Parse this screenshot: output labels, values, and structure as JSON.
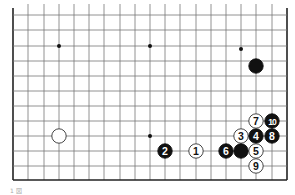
{
  "board": {
    "left": 13,
    "top": 15,
    "right": 287,
    "bottom": 180,
    "cols_x": [
      13,
      28,
      44,
      59,
      74,
      89,
      104,
      120,
      135,
      150,
      165,
      180,
      196,
      211,
      226,
      241,
      256,
      272,
      287
    ],
    "rows_y": [
      15,
      30,
      46,
      61,
      76,
      91,
      106,
      121,
      136,
      151,
      166,
      180
    ],
    "edges": [
      "left",
      "right",
      "bottom"
    ],
    "line_color": "#777777",
    "edge_color": "#222222"
  },
  "star_points": [
    {
      "x": 59,
      "y": 46
    },
    {
      "x": 150,
      "y": 46
    },
    {
      "x": 241,
      "y": 49
    },
    {
      "x": 150,
      "y": 136
    }
  ],
  "stones": [
    {
      "color": "black",
      "x": 256,
      "y": 66,
      "label": ""
    },
    {
      "color": "white",
      "x": 59,
      "y": 136,
      "label": ""
    },
    {
      "color": "white",
      "x": 196,
      "y": 151,
      "label": "1"
    },
    {
      "color": "black",
      "x": 165,
      "y": 151,
      "label": "2"
    },
    {
      "color": "white",
      "x": 241,
      "y": 136,
      "label": "3"
    },
    {
      "color": "black",
      "x": 256,
      "y": 136,
      "label": "4"
    },
    {
      "color": "white",
      "x": 256,
      "y": 151,
      "label": "5"
    },
    {
      "color": "black",
      "x": 226,
      "y": 151,
      "label": "6"
    },
    {
      "color": "black",
      "x": 241,
      "y": 151,
      "label": ""
    },
    {
      "color": "white",
      "x": 256,
      "y": 121,
      "label": "7"
    },
    {
      "color": "black",
      "x": 272,
      "y": 136,
      "label": "8"
    },
    {
      "color": "white",
      "x": 256,
      "y": 166,
      "label": "9"
    },
    {
      "color": "black",
      "x": 272,
      "y": 121,
      "label": "10"
    }
  ],
  "caption": "1 図"
}
